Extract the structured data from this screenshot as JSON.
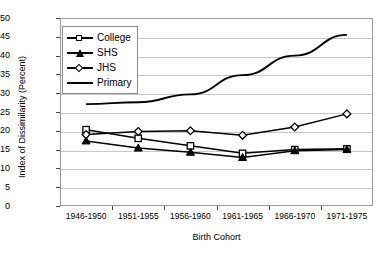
{
  "chart_data": {
    "type": "line",
    "title": "",
    "xlabel": "Birth Cohort",
    "ylabel": "Index of Dissimilarity (Percent)",
    "categories": [
      "1946-1950",
      "1951-1955",
      "1956-1960",
      "1961-1965",
      "1966-1970",
      "1971-1975"
    ],
    "ylim": [
      0,
      50
    ],
    "yticks": [
      0,
      5,
      10,
      15,
      20,
      25,
      30,
      35,
      40,
      45,
      50
    ],
    "grid": true,
    "legend_position": "upper-left",
    "series": [
      {
        "name": "College",
        "marker": "open-square",
        "values": [
          20.3,
          18.0,
          16.0,
          14.0,
          15.0,
          15.2
        ]
      },
      {
        "name": "SHS",
        "marker": "filled-triangle",
        "values": [
          17.3,
          15.4,
          14.3,
          12.9,
          14.7,
          15.0
        ]
      },
      {
        "name": "JHS",
        "marker": "open-diamond",
        "values": [
          19.0,
          19.8,
          20.0,
          18.8,
          21.0,
          24.5
        ]
      },
      {
        "name": "Primary",
        "marker": "none",
        "values": [
          27.1,
          27.6,
          29.7,
          34.8,
          40.0,
          45.5
        ]
      }
    ]
  },
  "legend": {
    "items": [
      {
        "label": "College"
      },
      {
        "label": "SHS"
      },
      {
        "label": "JHS"
      },
      {
        "label": "Primary"
      }
    ]
  }
}
